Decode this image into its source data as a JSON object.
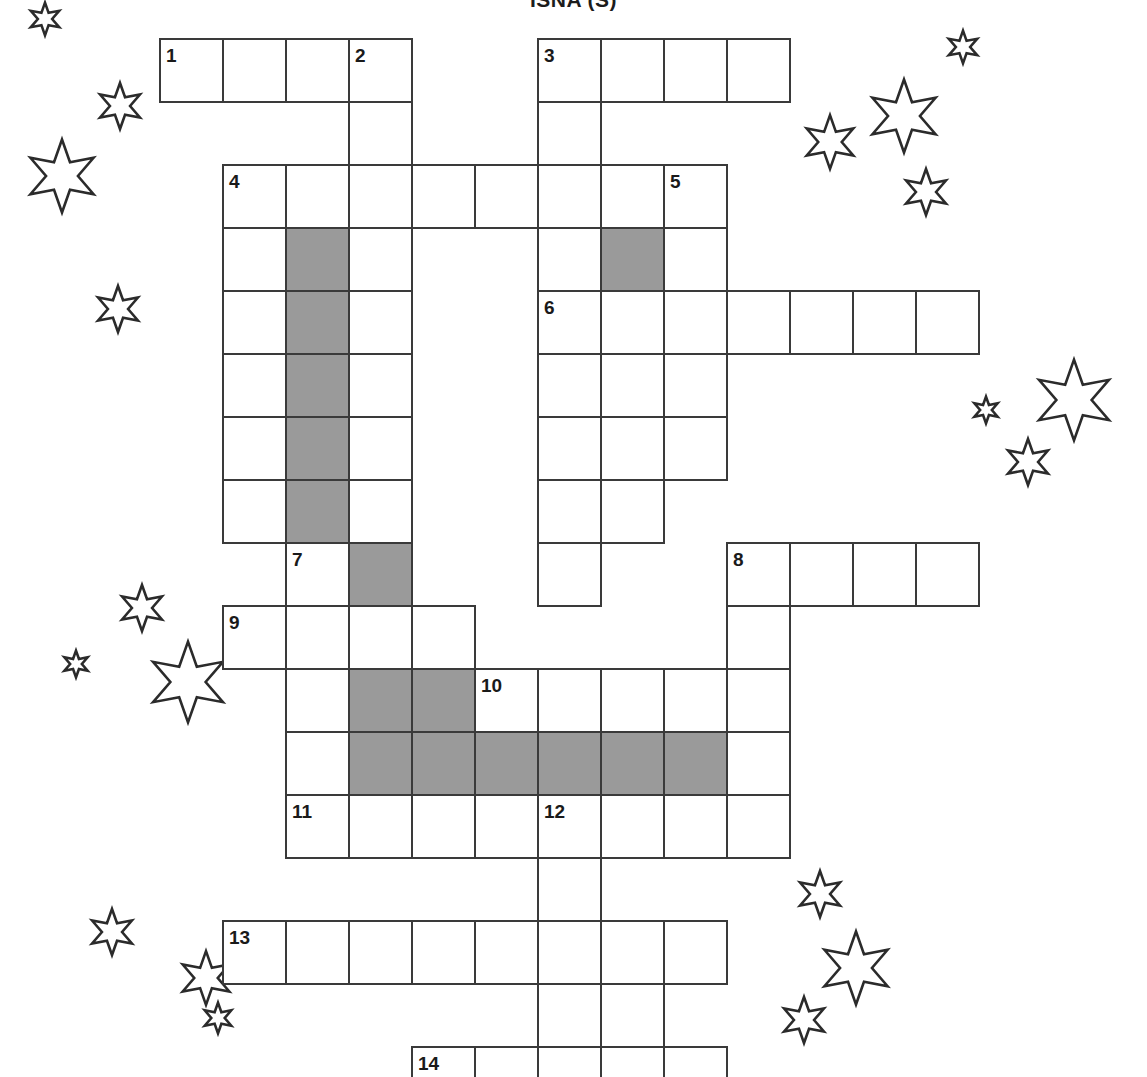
{
  "page": {
    "title": "ISNA (S)",
    "background_color": "#ffffff",
    "width": 1147,
    "height": 1077
  },
  "grid": {
    "origin_x": 159,
    "origin_y": 38,
    "cell_size": 63,
    "border_color": "#3a3a3a",
    "cell_color": "#ffffff",
    "shaded_color": "#9a9a9a",
    "columns": 14,
    "rows": 17,
    "cells": [
      {
        "col": 0,
        "row": 0,
        "shaded": false
      },
      {
        "col": 1,
        "row": 0,
        "shaded": false
      },
      {
        "col": 2,
        "row": 0,
        "shaded": false
      },
      {
        "col": 3,
        "row": 0,
        "shaded": false
      },
      {
        "col": 6,
        "row": 0,
        "shaded": false
      },
      {
        "col": 7,
        "row": 0,
        "shaded": false
      },
      {
        "col": 8,
        "row": 0,
        "shaded": false
      },
      {
        "col": 9,
        "row": 0,
        "shaded": false
      },
      {
        "col": 3,
        "row": 1,
        "shaded": false
      },
      {
        "col": 6,
        "row": 1,
        "shaded": false
      },
      {
        "col": 1,
        "row": 2,
        "shaded": false
      },
      {
        "col": 2,
        "row": 2,
        "shaded": false
      },
      {
        "col": 3,
        "row": 2,
        "shaded": false
      },
      {
        "col": 4,
        "row": 2,
        "shaded": false
      },
      {
        "col": 5,
        "row": 2,
        "shaded": false
      },
      {
        "col": 6,
        "row": 2,
        "shaded": false
      },
      {
        "col": 7,
        "row": 2,
        "shaded": false
      },
      {
        "col": 8,
        "row": 2,
        "shaded": false
      },
      {
        "col": 1,
        "row": 3,
        "shaded": false
      },
      {
        "col": 2,
        "row": 3,
        "shaded": true
      },
      {
        "col": 3,
        "row": 3,
        "shaded": false
      },
      {
        "col": 6,
        "row": 3,
        "shaded": false
      },
      {
        "col": 7,
        "row": 3,
        "shaded": true
      },
      {
        "col": 8,
        "row": 3,
        "shaded": false
      },
      {
        "col": 1,
        "row": 4,
        "shaded": false
      },
      {
        "col": 2,
        "row": 4,
        "shaded": true
      },
      {
        "col": 3,
        "row": 4,
        "shaded": false
      },
      {
        "col": 6,
        "row": 4,
        "shaded": false
      },
      {
        "col": 7,
        "row": 4,
        "shaded": false
      },
      {
        "col": 8,
        "row": 4,
        "shaded": false
      },
      {
        "col": 9,
        "row": 4,
        "shaded": false
      },
      {
        "col": 10,
        "row": 4,
        "shaded": false
      },
      {
        "col": 11,
        "row": 4,
        "shaded": false
      },
      {
        "col": 12,
        "row": 4,
        "shaded": false
      },
      {
        "col": 1,
        "row": 5,
        "shaded": false
      },
      {
        "col": 2,
        "row": 5,
        "shaded": true
      },
      {
        "col": 3,
        "row": 5,
        "shaded": false
      },
      {
        "col": 6,
        "row": 5,
        "shaded": false
      },
      {
        "col": 7,
        "row": 5,
        "shaded": false
      },
      {
        "col": 8,
        "row": 5,
        "shaded": false
      },
      {
        "col": 1,
        "row": 6,
        "shaded": false
      },
      {
        "col": 2,
        "row": 6,
        "shaded": true
      },
      {
        "col": 3,
        "row": 6,
        "shaded": false
      },
      {
        "col": 6,
        "row": 6,
        "shaded": false
      },
      {
        "col": 7,
        "row": 6,
        "shaded": false
      },
      {
        "col": 8,
        "row": 6,
        "shaded": false
      },
      {
        "col": 1,
        "row": 7,
        "shaded": false
      },
      {
        "col": 2,
        "row": 7,
        "shaded": true
      },
      {
        "col": 3,
        "row": 7,
        "shaded": false
      },
      {
        "col": 6,
        "row": 7,
        "shaded": false
      },
      {
        "col": 7,
        "row": 7,
        "shaded": false
      },
      {
        "col": 2,
        "row": 8,
        "shaded": false
      },
      {
        "col": 3,
        "row": 8,
        "shaded": true
      },
      {
        "col": 6,
        "row": 8,
        "shaded": false
      },
      {
        "col": 9,
        "row": 8,
        "shaded": false
      },
      {
        "col": 10,
        "row": 8,
        "shaded": false
      },
      {
        "col": 11,
        "row": 8,
        "shaded": false
      },
      {
        "col": 12,
        "row": 8,
        "shaded": false
      },
      {
        "col": 1,
        "row": 9,
        "shaded": false
      },
      {
        "col": 2,
        "row": 9,
        "shaded": false
      },
      {
        "col": 3,
        "row": 9,
        "shaded": false
      },
      {
        "col": 4,
        "row": 9,
        "shaded": false
      },
      {
        "col": 9,
        "row": 9,
        "shaded": false
      },
      {
        "col": 2,
        "row": 10,
        "shaded": false
      },
      {
        "col": 3,
        "row": 10,
        "shaded": true
      },
      {
        "col": 4,
        "row": 10,
        "shaded": true
      },
      {
        "col": 5,
        "row": 10,
        "shaded": false
      },
      {
        "col": 6,
        "row": 10,
        "shaded": false
      },
      {
        "col": 7,
        "row": 10,
        "shaded": false
      },
      {
        "col": 8,
        "row": 10,
        "shaded": false
      },
      {
        "col": 9,
        "row": 10,
        "shaded": false
      },
      {
        "col": 2,
        "row": 11,
        "shaded": false
      },
      {
        "col": 3,
        "row": 11,
        "shaded": true
      },
      {
        "col": 4,
        "row": 11,
        "shaded": true
      },
      {
        "col": 5,
        "row": 11,
        "shaded": true
      },
      {
        "col": 6,
        "row": 11,
        "shaded": true
      },
      {
        "col": 7,
        "row": 11,
        "shaded": true
      },
      {
        "col": 8,
        "row": 11,
        "shaded": true
      },
      {
        "col": 9,
        "row": 11,
        "shaded": false
      },
      {
        "col": 2,
        "row": 12,
        "shaded": false
      },
      {
        "col": 3,
        "row": 12,
        "shaded": false
      },
      {
        "col": 4,
        "row": 12,
        "shaded": false
      },
      {
        "col": 5,
        "row": 12,
        "shaded": false
      },
      {
        "col": 6,
        "row": 12,
        "shaded": false
      },
      {
        "col": 7,
        "row": 12,
        "shaded": false
      },
      {
        "col": 8,
        "row": 12,
        "shaded": false
      },
      {
        "col": 9,
        "row": 12,
        "shaded": false
      },
      {
        "col": 6,
        "row": 13,
        "shaded": false
      },
      {
        "col": 1,
        "row": 14,
        "shaded": false
      },
      {
        "col": 2,
        "row": 14,
        "shaded": false
      },
      {
        "col": 3,
        "row": 14,
        "shaded": false
      },
      {
        "col": 4,
        "row": 14,
        "shaded": false
      },
      {
        "col": 5,
        "row": 14,
        "shaded": false
      },
      {
        "col": 6,
        "row": 14,
        "shaded": false
      },
      {
        "col": 7,
        "row": 14,
        "shaded": false
      },
      {
        "col": 8,
        "row": 14,
        "shaded": false
      },
      {
        "col": 6,
        "row": 15,
        "shaded": false
      },
      {
        "col": 7,
        "row": 15,
        "shaded": false
      },
      {
        "col": 4,
        "row": 16,
        "shaded": false
      },
      {
        "col": 5,
        "row": 16,
        "shaded": false
      },
      {
        "col": 6,
        "row": 16,
        "shaded": false
      },
      {
        "col": 7,
        "row": 16,
        "shaded": false
      },
      {
        "col": 8,
        "row": 16,
        "shaded": false
      }
    ],
    "clue_numbers": [
      {
        "number": "1",
        "col": 0,
        "row": 0
      },
      {
        "number": "2",
        "col": 3,
        "row": 0
      },
      {
        "number": "3",
        "col": 6,
        "row": 0
      },
      {
        "number": "4",
        "col": 1,
        "row": 2
      },
      {
        "number": "5",
        "col": 8,
        "row": 2
      },
      {
        "number": "6",
        "col": 6,
        "row": 4
      },
      {
        "number": "7",
        "col": 2,
        "row": 8
      },
      {
        "number": "8",
        "col": 9,
        "row": 8
      },
      {
        "number": "9",
        "col": 1,
        "row": 9
      },
      {
        "number": "10",
        "col": 5,
        "row": 10
      },
      {
        "number": "11",
        "col": 2,
        "row": 12
      },
      {
        "number": "12",
        "col": 6,
        "row": 12
      },
      {
        "number": "13",
        "col": 1,
        "row": 14
      },
      {
        "number": "14",
        "col": 4,
        "row": 16
      }
    ]
  },
  "decorations": {
    "icon_name": "six-point-star-icon",
    "stroke_color": "#2b2b2b",
    "stars": [
      {
        "x": 28,
        "y": 2,
        "size": 34
      },
      {
        "x": 96,
        "y": 82,
        "size": 48
      },
      {
        "x": 24,
        "y": 138,
        "size": 76
      },
      {
        "x": 94,
        "y": 285,
        "size": 48
      },
      {
        "x": 946,
        "y": 30,
        "size": 34
      },
      {
        "x": 866,
        "y": 78,
        "size": 76
      },
      {
        "x": 802,
        "y": 114,
        "size": 56
      },
      {
        "x": 902,
        "y": 168,
        "size": 48
      },
      {
        "x": 1032,
        "y": 358,
        "size": 84
      },
      {
        "x": 972,
        "y": 396,
        "size": 28
      },
      {
        "x": 1004,
        "y": 438,
        "size": 48
      },
      {
        "x": 118,
        "y": 584,
        "size": 48
      },
      {
        "x": 62,
        "y": 650,
        "size": 28
      },
      {
        "x": 146,
        "y": 640,
        "size": 84
      },
      {
        "x": 796,
        "y": 870,
        "size": 48
      },
      {
        "x": 88,
        "y": 908,
        "size": 48
      },
      {
        "x": 818,
        "y": 930,
        "size": 76
      },
      {
        "x": 178,
        "y": 950,
        "size": 56
      },
      {
        "x": 202,
        "y": 1002,
        "size": 32
      },
      {
        "x": 780,
        "y": 996,
        "size": 48
      }
    ]
  }
}
